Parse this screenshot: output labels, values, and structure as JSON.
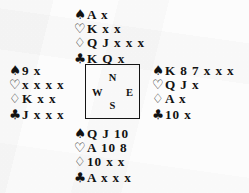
{
  "diagram": {
    "type": "bridge-hand-diagram",
    "suit_symbols": {
      "spades": "♠",
      "hearts": "♡",
      "diamonds": "♢",
      "clubs": "♣"
    },
    "suit_order": [
      "spades",
      "hearts",
      "diamonds",
      "clubs"
    ],
    "compass": {
      "north": "N",
      "west": "W",
      "east": "E",
      "south": "S"
    },
    "hands": {
      "north": {
        "position_label": "N",
        "spades": "A x",
        "hearts": "K x x",
        "diamonds": "Q J x x x",
        "clubs": "K Q x"
      },
      "west": {
        "position_label": "W",
        "spades": "9 x",
        "hearts": "x x x x",
        "diamonds": "K x x",
        "clubs": "J x x x"
      },
      "east": {
        "position_label": "E",
        "spades": "K 8 7 x x x",
        "hearts": "Q J x",
        "diamonds": "A x",
        "clubs": "10 x"
      },
      "south": {
        "position_label": "S",
        "spades": "Q J 10",
        "hearts": "A 10 8",
        "diamonds": "10 x x",
        "clubs": "A x x x"
      }
    },
    "colors": {
      "ink": "#121212",
      "paper": "#fdfdfd"
    }
  }
}
